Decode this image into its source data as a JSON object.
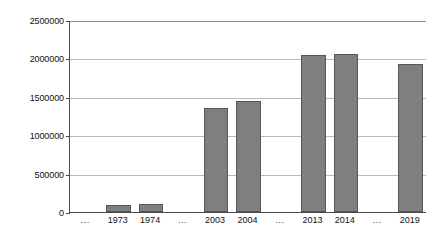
{
  "chart_data": {
    "type": "bar",
    "title": "",
    "subtitle": "",
    "xlabel": "",
    "ylabel": "",
    "categories": [
      "...",
      "1973",
      "1974",
      "...",
      "2003",
      "2004",
      "...",
      "2013",
      "2014",
      "...",
      "2019"
    ],
    "values": [
      null,
      90000,
      105000,
      null,
      1360000,
      1440000,
      null,
      2040000,
      2060000,
      null,
      1930000
    ],
    "ylim": [
      0,
      2500000
    ],
    "ytick_labels": [
      "2500000",
      "2000000",
      "1500000",
      "1000000",
      "500000",
      "0"
    ],
    "ytick_values": [
      2500000,
      2000000,
      1500000,
      1000000,
      500000,
      0
    ],
    "grid": true,
    "legend": null,
    "legend_position": "none",
    "bar_color": "#7f7f7f",
    "bar_border_color": "#565656",
    "gridline_color": "#b9b9b9",
    "axis_color": "#4a4a4a",
    "background_color": "#ffffff"
  }
}
